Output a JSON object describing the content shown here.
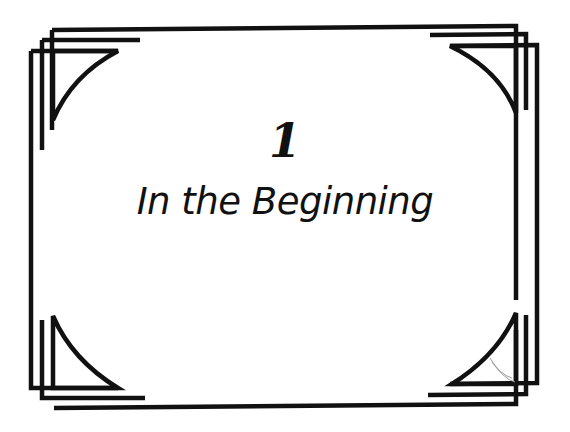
{
  "page": {
    "chapter_number": "1",
    "chapter_title": "In the Beginning"
  },
  "colors": {
    "ink": "#111111",
    "background": "#ffffff",
    "pencil_mark": "#9a9a9a"
  },
  "decoration": {
    "frame_style": "triple-offset-art-deco-border",
    "corner_ornament": "curved-triangle"
  }
}
